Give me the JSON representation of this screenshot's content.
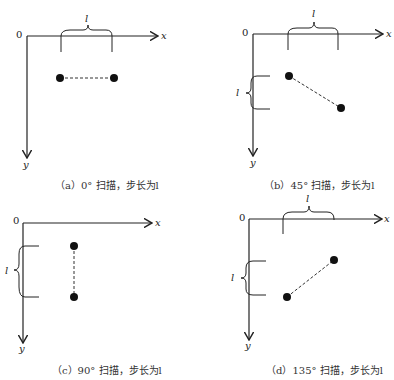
{
  "panels": [
    {
      "id": "a",
      "caption": "（a）0°  扫描，步长为l",
      "angle_deg": 0
    },
    {
      "id": "b",
      "caption": "（b）45°  扫描，步长为l",
      "angle_deg": 45
    },
    {
      "id": "c",
      "caption": "（c）90°  扫描，步长为l",
      "angle_deg": 90
    },
    {
      "id": "d",
      "caption": "（d）135°  扫描，步长为l",
      "angle_deg": 135
    }
  ],
  "axis": {
    "origin": "0",
    "x": "x",
    "y": "y",
    "step": "l"
  }
}
